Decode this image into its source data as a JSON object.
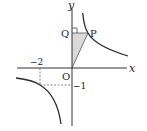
{
  "figure": {
    "type": "hyperbola-graph",
    "equation_implied": "y = 2/x",
    "axes": {
      "x_label": "x",
      "y_label": "y",
      "origin_label": "O"
    },
    "points": {
      "P": {
        "label": "P",
        "x": 1,
        "y": 2
      },
      "Q": {
        "label": "Q",
        "x": 0,
        "y": 2
      },
      "O": {
        "label": "O",
        "x": 0,
        "y": 0
      }
    },
    "tick_labels": {
      "x_neg2": "−2",
      "y_neg1": "−1"
    },
    "guide_point": {
      "x": -2,
      "y": -1
    },
    "shaded_region": "triangle OPQ",
    "colors": {
      "curve": "#2a2a2a",
      "axis": "#333333",
      "shade": "#d9d9d9",
      "dashed": "#555555"
    }
  }
}
